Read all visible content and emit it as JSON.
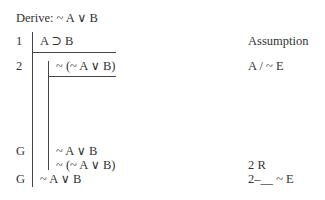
{
  "header": {
    "derive_label": "Derive: ~ A ∨ B"
  },
  "lines": [
    {
      "num": "1",
      "formula": "A ⊃ B",
      "justification": "Assumption"
    },
    {
      "num": "2",
      "formula": "~ (~ A ∨ B)",
      "justification": "A / ~ E"
    },
    {
      "num": "G",
      "formula": "~ A ∨ B",
      "justification": ""
    },
    {
      "num": "",
      "formula": "~ (~ A ∨ B)",
      "justification": "2 R"
    },
    {
      "num": "G",
      "formula": "~ A ∨ B",
      "justification": "2–__ ~ E"
    }
  ],
  "colors": {
    "text": "#333333",
    "rule": "#444444"
  }
}
